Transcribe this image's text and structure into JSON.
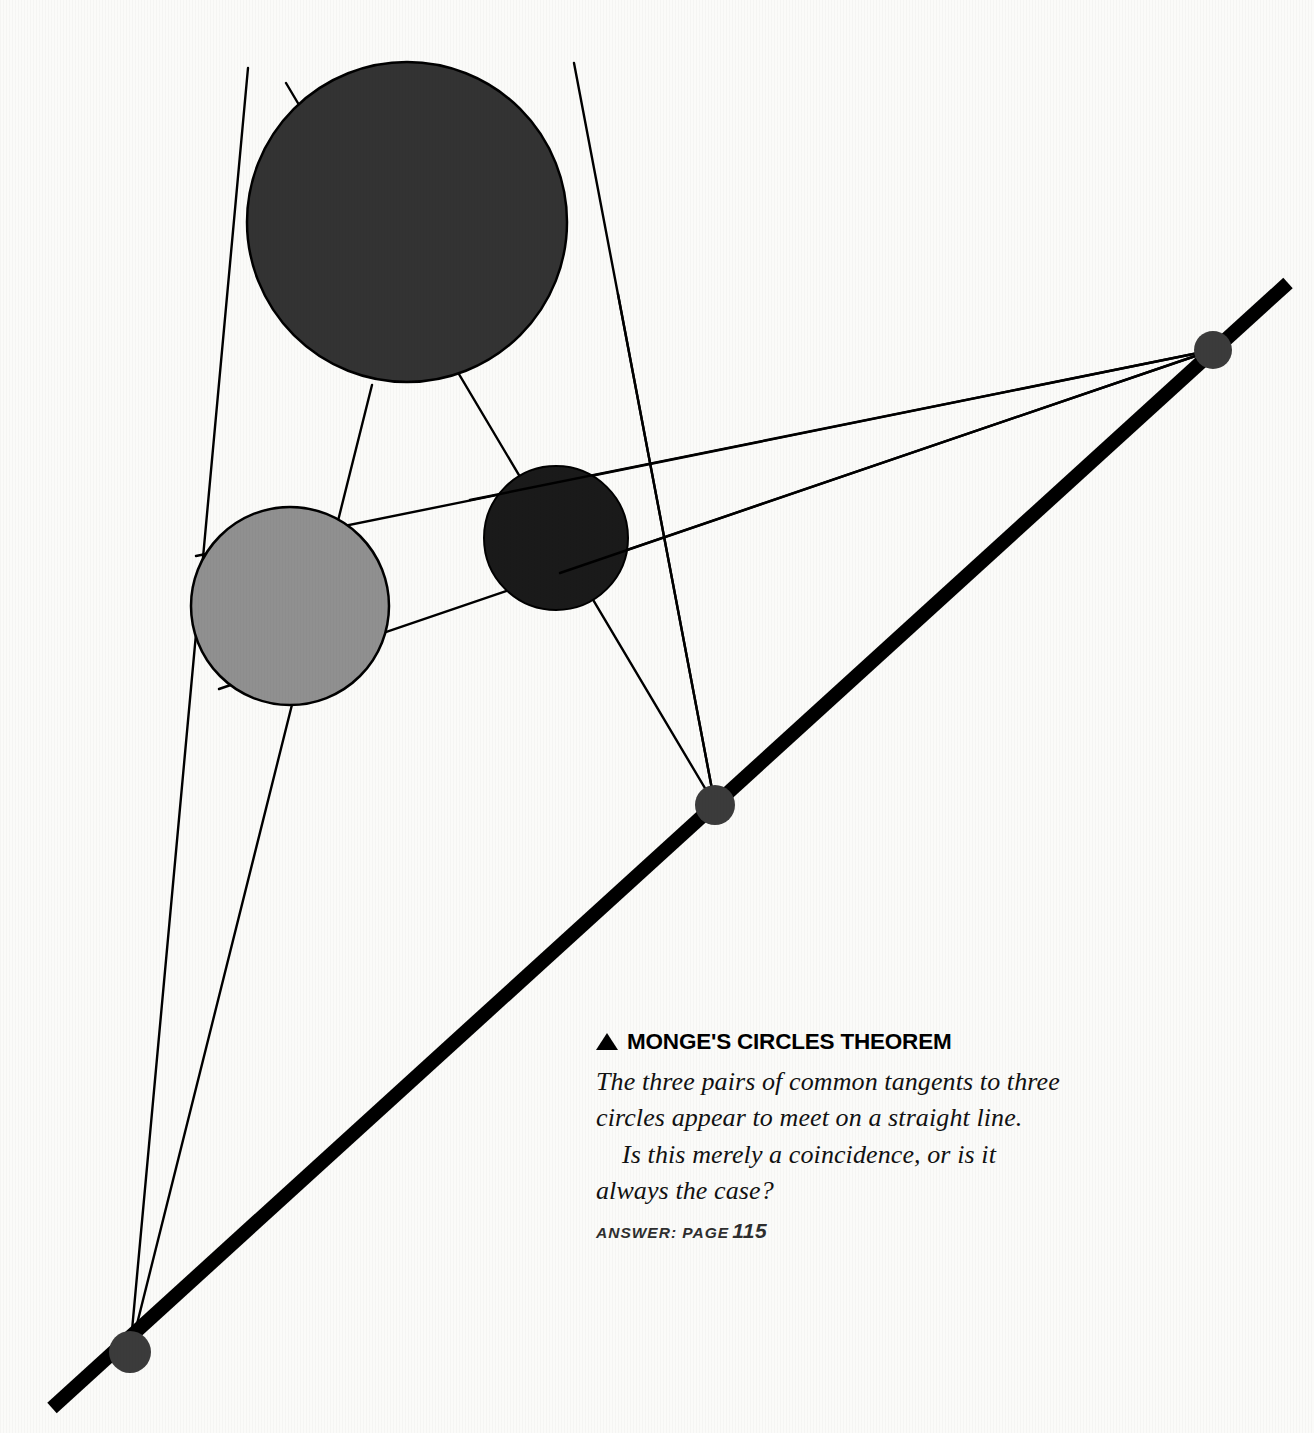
{
  "page": {
    "width": 1314,
    "height": 1433,
    "background_color": "#fbfbf9"
  },
  "caption": {
    "marker_icon": "triangle-up-icon",
    "heading": "MONGE'S CIRCLES THEOREM",
    "paragraph_1": "The three pairs of common tangents to three circles appear to meet on a straight line.",
    "paragraph_2": "Is this merely a coincidence, or is it always the case?",
    "answer_label": "ANSWER: PAGE",
    "answer_page": "115",
    "answer_full": "ANSWER: PAGE 115"
  },
  "chart_data": {
    "type": "diagram",
    "title": "MONGE'S CIRCLES THEOREM",
    "colors": {
      "background": "#fbfbf9",
      "circle_large": "#333333",
      "circle_small": "#1a1a1a",
      "circle_gray": "#909090",
      "circle_outline": "#000000",
      "tangent_line": "#000000",
      "monge_line": "#000000",
      "center_dot": "#3b3b3b",
      "heading_text": "#000000",
      "body_text": "#111111",
      "answer_text": "#2e2e2e"
    },
    "circles": [
      {
        "name": "large-dark-circle",
        "cx": 407,
        "cy": 222,
        "r": 160,
        "fill": "#333333",
        "stroke": "#000000",
        "stroke_width": 2.5
      },
      {
        "name": "gray-circle",
        "cx": 290,
        "cy": 606,
        "r": 99,
        "fill": "#909090",
        "stroke": "#000000",
        "stroke_width": 2.5
      },
      {
        "name": "small-black-circle",
        "cx": 556,
        "cy": 538,
        "r": 72,
        "fill": "#1a1a1a",
        "stroke": "#000000",
        "stroke_width": 2.0
      }
    ],
    "monge_line": {
      "name": "monge-line",
      "x1": 52,
      "y1": 1408,
      "x2": 1288,
      "y2": 283,
      "stroke": "#000000",
      "stroke_width": 14
    },
    "homothetic_centers": [
      {
        "name": "center-bottom-left",
        "cx": 130,
        "cy": 1352,
        "r": 21,
        "pair": [
          "large-dark-circle",
          "gray-circle"
        ]
      },
      {
        "name": "center-middle",
        "cx": 715,
        "cy": 805,
        "r": 20,
        "pair": [
          "large-dark-circle",
          "small-black-circle"
        ]
      },
      {
        "name": "center-top-right",
        "cx": 1213,
        "cy": 350,
        "r": 19,
        "pair": [
          "gray-circle",
          "small-black-circle"
        ]
      }
    ],
    "tangent_lines": [
      {
        "name": "tangent-bl-1",
        "x1": 130,
        "y1": 1352,
        "x2": 248,
        "y2": 68,
        "from_center": "center-bottom-left"
      },
      {
        "name": "tangent-bl-2",
        "x1": 130,
        "y1": 1352,
        "x2": 372,
        "y2": 385,
        "from_center": "center-bottom-left"
      },
      {
        "name": "tangent-m-1",
        "x1": 715,
        "y1": 805,
        "x2": 286,
        "y2": 83,
        "from_center": "center-middle"
      },
      {
        "name": "tangent-m-2",
        "x1": 715,
        "y1": 805,
        "x2": 574,
        "y2": 63,
        "from_center": "center-middle"
      },
      {
        "name": "tangent-tr-1",
        "x1": 1213,
        "y1": 350,
        "x2": 196,
        "y2": 556,
        "from_center": "center-top-right"
      },
      {
        "name": "tangent-tr-2",
        "x1": 1213,
        "y1": 350,
        "x2": 219,
        "y2": 689,
        "from_center": "center-top-right"
      }
    ],
    "legend_position": "none",
    "grid": false,
    "axes": false
  }
}
